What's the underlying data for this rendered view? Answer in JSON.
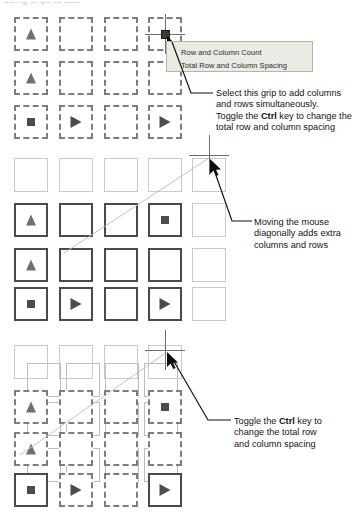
{
  "page": {
    "top_partial_heading": "Using Grips to Edit"
  },
  "tooltip": {
    "name": "grip-tooltip",
    "items": [
      {
        "label": "Row and Column Count"
      },
      {
        "label": "Total Row and Column Spacing"
      }
    ]
  },
  "callouts": [
    {
      "id": "callout-1",
      "lines": [
        {
          "parts": [
            {
              "text": "Select this grip to add columns",
              "bold": false
            }
          ]
        },
        {
          "parts": [
            {
              "text": "and rows simultaneously.",
              "bold": false
            }
          ]
        },
        {
          "parts": [
            {
              "text": "Toggle the ",
              "bold": false
            },
            {
              "text": "Ctrl",
              "bold": true
            },
            {
              "text": " key to change the",
              "bold": false
            }
          ]
        },
        {
          "parts": [
            {
              "text": "total row and column spacing",
              "bold": false
            }
          ]
        }
      ]
    },
    {
      "id": "callout-2",
      "lines": [
        {
          "parts": [
            {
              "text": "Moving the mouse",
              "bold": false
            }
          ]
        },
        {
          "parts": [
            {
              "text": "diagonally adds extra",
              "bold": false
            }
          ]
        },
        {
          "parts": [
            {
              "text": "columns and rows",
              "bold": false
            }
          ]
        }
      ]
    },
    {
      "id": "callout-3",
      "lines": [
        {
          "parts": [
            {
              "text": "Toggle the ",
              "bold": false
            },
            {
              "text": "Ctrl",
              "bold": true
            },
            {
              "text": " key to",
              "bold": false
            }
          ]
        },
        {
          "parts": [
            {
              "text": "change the total row",
              "bold": false
            }
          ]
        },
        {
          "parts": [
            {
              "text": "and column spacing",
              "bold": false
            }
          ]
        }
      ]
    }
  ],
  "colors": {
    "dashed_border": "#7d7d7d",
    "solid_border": "#4a4a4a",
    "ghost_border": "#c9c9c9",
    "grip_fill": "#3b3b3b",
    "tooltip_bg": "#eceae4",
    "tooltip_border": "#b6b3ab",
    "text": "#141414"
  },
  "grids": [
    {
      "id": "grid-1",
      "caption": "array-grid-initial",
      "columns": 4,
      "rows": 3,
      "col_x": [
        14,
        59,
        104,
        148
      ],
      "row_y": [
        17,
        61,
        105
      ],
      "cell_size": 34,
      "cells": [
        {
          "r": 0,
          "c": 0,
          "style": "dashed",
          "glyph": "triangle-up"
        },
        {
          "r": 0,
          "c": 1,
          "style": "dashed",
          "glyph": "none"
        },
        {
          "r": 0,
          "c": 2,
          "style": "dashed",
          "glyph": "none"
        },
        {
          "r": 0,
          "c": 3,
          "style": "dashed",
          "glyph": "none"
        },
        {
          "r": 1,
          "c": 0,
          "style": "dashed",
          "glyph": "triangle-up"
        },
        {
          "r": 1,
          "c": 1,
          "style": "dashed",
          "glyph": "none"
        },
        {
          "r": 1,
          "c": 2,
          "style": "dashed",
          "glyph": "none"
        },
        {
          "r": 1,
          "c": 3,
          "style": "dashed",
          "glyph": "none"
        },
        {
          "r": 2,
          "c": 0,
          "style": "dashed",
          "glyph": "square"
        },
        {
          "r": 2,
          "c": 1,
          "style": "dashed",
          "glyph": "triangle-right"
        },
        {
          "r": 2,
          "c": 2,
          "style": "dashed",
          "glyph": "none"
        },
        {
          "r": 2,
          "c": 3,
          "style": "dashed",
          "glyph": "triangle-right"
        }
      ]
    },
    {
      "id": "grid-2",
      "caption": "array-grid-dragging-diagonally",
      "columns": 5,
      "rows": 4,
      "col_x": [
        14,
        59,
        104,
        148,
        192
      ],
      "row_y": [
        158,
        203,
        248,
        287
      ],
      "cell_size": 34,
      "cells": [
        {
          "r": 0,
          "c": 0,
          "style": "ghost",
          "glyph": "none"
        },
        {
          "r": 0,
          "c": 1,
          "style": "ghost",
          "glyph": "none"
        },
        {
          "r": 0,
          "c": 2,
          "style": "ghost",
          "glyph": "none"
        },
        {
          "r": 0,
          "c": 3,
          "style": "ghost",
          "glyph": "none"
        },
        {
          "r": 0,
          "c": 4,
          "style": "ghost",
          "glyph": "none"
        },
        {
          "r": 1,
          "c": 0,
          "style": "solid",
          "glyph": "triangle-up"
        },
        {
          "r": 1,
          "c": 1,
          "style": "solid",
          "glyph": "none"
        },
        {
          "r": 1,
          "c": 2,
          "style": "solid",
          "glyph": "none"
        },
        {
          "r": 1,
          "c": 3,
          "style": "solid",
          "glyph": "square"
        },
        {
          "r": 1,
          "c": 4,
          "style": "ghost",
          "glyph": "none"
        },
        {
          "r": 2,
          "c": 0,
          "style": "solid",
          "glyph": "triangle-up"
        },
        {
          "r": 2,
          "c": 1,
          "style": "solid",
          "glyph": "none"
        },
        {
          "r": 2,
          "c": 2,
          "style": "solid",
          "glyph": "none"
        },
        {
          "r": 2,
          "c": 3,
          "style": "solid",
          "glyph": "none"
        },
        {
          "r": 2,
          "c": 4,
          "style": "ghost",
          "glyph": "none"
        },
        {
          "r": 3,
          "c": 0,
          "style": "solid",
          "glyph": "square"
        },
        {
          "r": 3,
          "c": 1,
          "style": "solid",
          "glyph": "triangle-right"
        },
        {
          "r": 3,
          "c": 2,
          "style": "solid",
          "glyph": "none"
        },
        {
          "r": 3,
          "c": 3,
          "style": "solid",
          "glyph": "triangle-right"
        },
        {
          "r": 3,
          "c": 4,
          "style": "ghost",
          "glyph": "none"
        }
      ]
    },
    {
      "id": "grid-3",
      "caption": "array-grid-ctrl-spacing",
      "columns": 4,
      "rows": 4,
      "col_x": [
        14,
        59,
        104,
        148
      ],
      "row_y": [
        345,
        390,
        432,
        473
      ],
      "cell_size": 34,
      "cells": [
        {
          "r": 0,
          "c": 0,
          "style": "ghost",
          "glyph": "none"
        },
        {
          "r": 0,
          "c": 1,
          "style": "ghost",
          "glyph": "none"
        },
        {
          "r": 0,
          "c": 2,
          "style": "ghost",
          "glyph": "none"
        },
        {
          "r": 0,
          "c": 3,
          "style": "ghost",
          "glyph": "none"
        },
        {
          "r": 1,
          "c": 0,
          "style": "dashed",
          "glyph": "triangle-up"
        },
        {
          "r": 1,
          "c": 1,
          "style": "dashed",
          "glyph": "none"
        },
        {
          "r": 1,
          "c": 2,
          "style": "dashed",
          "glyph": "none"
        },
        {
          "r": 1,
          "c": 3,
          "style": "dashed",
          "glyph": "square"
        },
        {
          "r": 2,
          "c": 0,
          "style": "dashed",
          "glyph": "triangle-up"
        },
        {
          "r": 2,
          "c": 1,
          "style": "dashed",
          "glyph": "none"
        },
        {
          "r": 2,
          "c": 2,
          "style": "dashed",
          "glyph": "none"
        },
        {
          "r": 2,
          "c": 3,
          "style": "dashed",
          "glyph": "none"
        },
        {
          "r": 3,
          "c": 0,
          "style": "solid",
          "glyph": "square"
        },
        {
          "r": 3,
          "c": 1,
          "style": "dashed",
          "glyph": "triangle-right"
        },
        {
          "r": 3,
          "c": 2,
          "style": "dashed",
          "glyph": "none"
        },
        {
          "r": 3,
          "c": 3,
          "style": "solid",
          "glyph": "triangle-right"
        }
      ],
      "overlay_cells": [
        {
          "x": 27,
          "y": 363,
          "size": 34
        },
        {
          "x": 66,
          "y": 363,
          "size": 34
        },
        {
          "x": 105,
          "y": 363,
          "size": 34
        },
        {
          "x": 144,
          "y": 363,
          "size": 34
        },
        {
          "x": 27,
          "y": 402,
          "size": 34
        },
        {
          "x": 66,
          "y": 402,
          "size": 34
        },
        {
          "x": 105,
          "y": 402,
          "size": 34
        },
        {
          "x": 144,
          "y": 402,
          "size": 34
        },
        {
          "x": 27,
          "y": 448,
          "size": 34
        },
        {
          "x": 66,
          "y": 448,
          "size": 34
        },
        {
          "x": 105,
          "y": 448,
          "size": 34
        },
        {
          "x": 144,
          "y": 448,
          "size": 34
        }
      ]
    }
  ],
  "grips": [
    {
      "id": "grip-1",
      "x": 165,
      "y": 34,
      "type": "grip-square-crosshair"
    },
    {
      "id": "grip-2",
      "x": 209,
      "y": 155,
      "type": "crosshair"
    },
    {
      "id": "grip-3",
      "x": 165,
      "y": 350,
      "type": "crosshair"
    }
  ]
}
